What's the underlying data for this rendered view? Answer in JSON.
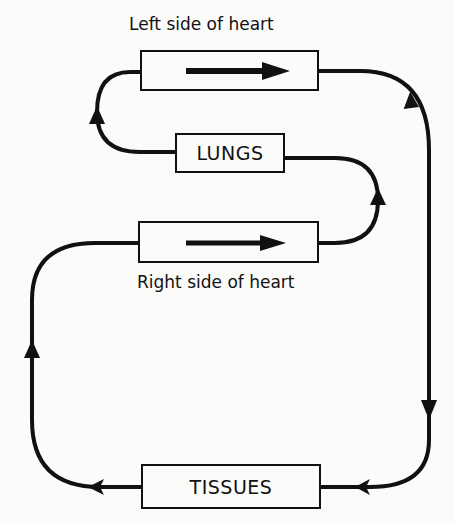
{
  "diagram": {
    "type": "circulation-flow",
    "colors": {
      "stroke": "#111111",
      "background": "#fbfbfa"
    },
    "nodes": [
      {
        "id": "left_heart",
        "label": "",
        "caption": "Left side of heart",
        "has_direction_arrow": true,
        "arrow_direction": "right"
      },
      {
        "id": "lungs",
        "label": "LUNGS"
      },
      {
        "id": "right_heart",
        "label": "",
        "caption": "Right side of heart",
        "has_direction_arrow": true,
        "arrow_direction": "right"
      },
      {
        "id": "tissues",
        "label": "TISSUES"
      }
    ],
    "edges": [
      {
        "from": "left_heart",
        "to": "tissues",
        "path": "right-outer-loop",
        "arrow": "down"
      },
      {
        "from": "tissues",
        "to": "right_heart",
        "path": "left-outer-loop",
        "arrow": "up"
      },
      {
        "from": "right_heart",
        "to": "lungs",
        "path": "right-inner-loop",
        "arrow": "up"
      },
      {
        "from": "lungs",
        "to": "left_heart",
        "path": "left-inner-loop",
        "arrow": "up"
      }
    ]
  }
}
